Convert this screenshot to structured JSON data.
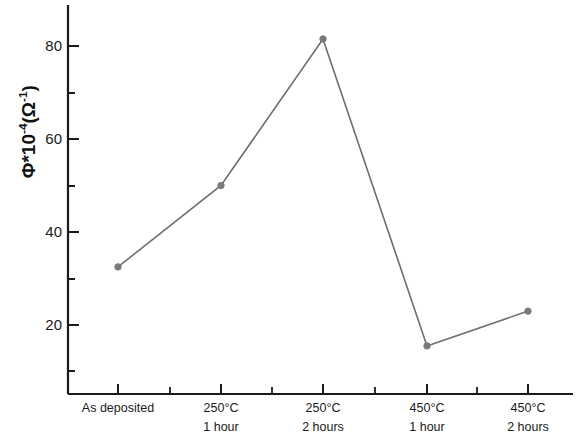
{
  "chart_data": {
    "type": "line",
    "title": "",
    "xlabel": "",
    "ylabel": "Φ*10⁻⁴(Ω⁻¹)",
    "categories": [
      "As deposited",
      "250°C 1 hour",
      "250°C 2 hours",
      "450°C 1 hour",
      "450°C 2 hours"
    ],
    "category_lines": [
      {
        "line1": "As deposited",
        "line2": ""
      },
      {
        "line1": "250°C",
        "line2": "1 hour"
      },
      {
        "line1": "250°C",
        "line2": "2 hours"
      },
      {
        "line1": "450°C",
        "line2": "1 hour"
      },
      {
        "line1": "450°C",
        "line2": "2 hours"
      }
    ],
    "values": [
      32.5,
      50,
      81.5,
      15.5,
      23
    ],
    "ylim": [
      7,
      87
    ],
    "yticks": [
      20,
      40,
      60,
      80
    ],
    "ytick_labels": [
      "20",
      "40",
      "60",
      "80"
    ],
    "yminor_ticks": [
      10,
      30,
      50,
      70
    ],
    "grid": false,
    "legend": null,
    "series_color": "#6e6e6e",
    "marker_color": "#7a7a7a",
    "axis_color": "#1a1a1a"
  },
  "axis": {
    "y_label_line": "Φ*10",
    "y_label_exp1": "-4",
    "y_label_mid": "(Ω",
    "y_label_exp2": "-1",
    "y_label_end": ")"
  }
}
